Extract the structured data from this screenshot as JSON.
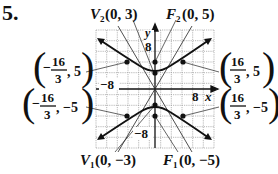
{
  "problem_number": "5.",
  "graph": {
    "x_axis_label": "x",
    "y_axis_label": "y",
    "tick_labels": {
      "x_neg": "−8",
      "x_pos": "8",
      "y_pos": "8",
      "y_neg": "−8"
    },
    "range": {
      "x": [
        -11,
        11
      ],
      "y": [
        -11,
        11
      ]
    },
    "grid_step": 2
  },
  "labels": {
    "v2": {
      "name": "V",
      "sub": "2",
      "coords": "(0, 3)"
    },
    "f2": {
      "name": "F",
      "sub": "2",
      "coords": "(0, 5)"
    },
    "v1": {
      "name": "V",
      "sub": "1",
      "coords": "(0, −3)"
    },
    "f1": {
      "name": "F",
      "sub": "1",
      "coords": "(0, −5)"
    },
    "p_top_left": {
      "sign": "−",
      "num": "16",
      "den": "3",
      "y": ", 5"
    },
    "p_top_right": {
      "sign": "",
      "num": "16",
      "den": "3",
      "y": ", 5"
    },
    "p_bot_left": {
      "sign": "−",
      "num": "16",
      "den": "3",
      "y": ", −5"
    },
    "p_bot_right": {
      "sign": "",
      "num": "16",
      "den": "3",
      "y": ", −5"
    }
  },
  "hyperbola": {
    "equation_form": "y^2/9 - x^2/16 = 1",
    "vertices": [
      [
        0,
        3
      ],
      [
        0,
        -3
      ]
    ],
    "foci": [
      [
        0,
        5
      ],
      [
        0,
        -5
      ]
    ],
    "latus_points": [
      [
        -5.333,
        5
      ],
      [
        5.333,
        5
      ],
      [
        -5.333,
        -5
      ],
      [
        5.333,
        -5
      ]
    ]
  },
  "colors": {
    "ink": "#111111",
    "grid": "#888888",
    "background": "#ffffff"
  }
}
